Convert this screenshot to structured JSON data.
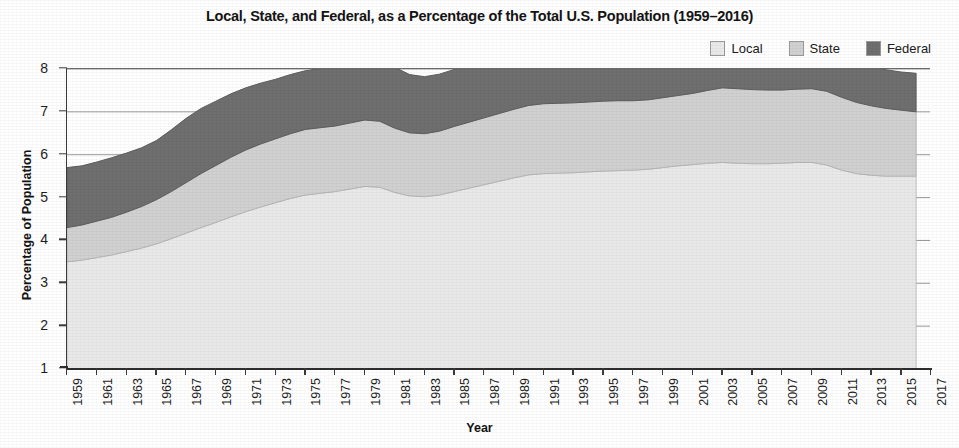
{
  "chart_data": {
    "type": "area",
    "stacked": true,
    "title": "Local, State, and Federal, as a Percentage of the Total U.S. Population (1959–2016)",
    "xlabel": "Year",
    "ylabel": "Percentage of Population",
    "xlim": [
      1959,
      2017
    ],
    "ylim": [
      1,
      8
    ],
    "ytick_step": 1,
    "xtick_step": 2,
    "grid": "horizontal",
    "legend_position": "top-right",
    "data_end_year": 2016,
    "ytick_labels": [
      "1",
      "2",
      "3",
      "4",
      "5",
      "6",
      "7",
      "8"
    ],
    "xtick_labels": [
      "1959",
      "1961",
      "1963",
      "1965",
      "1967",
      "1969",
      "1971",
      "1973",
      "1975",
      "1977",
      "1979",
      "1981",
      "1983",
      "1985",
      "1987",
      "1989",
      "1991",
      "1993",
      "1995",
      "1997",
      "1999",
      "2001",
      "2003",
      "2005",
      "2007",
      "2009",
      "2011",
      "2013",
      "2015",
      "2017"
    ],
    "x": [
      1959,
      1960,
      1961,
      1962,
      1963,
      1964,
      1965,
      1966,
      1967,
      1968,
      1969,
      1970,
      1971,
      1972,
      1973,
      1974,
      1975,
      1976,
      1977,
      1978,
      1979,
      1980,
      1981,
      1982,
      1983,
      1984,
      1985,
      1986,
      1987,
      1988,
      1989,
      1990,
      1991,
      1992,
      1993,
      1994,
      1995,
      1996,
      1997,
      1998,
      1999,
      2000,
      2001,
      2002,
      2003,
      2004,
      2005,
      2006,
      2007,
      2008,
      2009,
      2010,
      2011,
      2012,
      2013,
      2014,
      2015,
      2016
    ],
    "series": [
      {
        "name": "Local",
        "color": "#e9e9e9",
        "values": [
          2.5,
          2.54,
          2.6,
          2.66,
          2.74,
          2.82,
          2.92,
          3.04,
          3.17,
          3.3,
          3.42,
          3.55,
          3.67,
          3.78,
          3.88,
          3.98,
          4.06,
          4.1,
          4.14,
          4.2,
          4.26,
          4.24,
          4.12,
          4.04,
          4.02,
          4.06,
          4.14,
          4.22,
          4.3,
          4.38,
          4.46,
          4.53,
          4.56,
          4.57,
          4.58,
          4.6,
          4.62,
          4.63,
          4.64,
          4.66,
          4.7,
          4.74,
          4.77,
          4.8,
          4.82,
          4.8,
          4.79,
          4.79,
          4.8,
          4.82,
          4.82,
          4.76,
          4.64,
          4.56,
          4.52,
          4.5,
          4.5,
          4.5
        ]
      },
      {
        "name": "State",
        "color": "#d1d1d1",
        "values": [
          0.8,
          0.82,
          0.85,
          0.88,
          0.92,
          0.97,
          1.03,
          1.1,
          1.18,
          1.26,
          1.33,
          1.39,
          1.44,
          1.47,
          1.49,
          1.51,
          1.53,
          1.53,
          1.53,
          1.54,
          1.55,
          1.54,
          1.5,
          1.47,
          1.47,
          1.49,
          1.52,
          1.54,
          1.56,
          1.58,
          1.6,
          1.62,
          1.63,
          1.63,
          1.63,
          1.63,
          1.63,
          1.63,
          1.62,
          1.62,
          1.63,
          1.64,
          1.66,
          1.7,
          1.74,
          1.74,
          1.73,
          1.72,
          1.71,
          1.71,
          1.72,
          1.72,
          1.7,
          1.66,
          1.62,
          1.58,
          1.54,
          1.5
        ]
      },
      {
        "name": "Federal",
        "color": "#6f6f6f",
        "values": [
          1.4,
          1.38,
          1.38,
          1.39,
          1.38,
          1.37,
          1.38,
          1.44,
          1.5,
          1.52,
          1.5,
          1.48,
          1.45,
          1.42,
          1.39,
          1.38,
          1.37,
          1.38,
          1.4,
          1.44,
          1.46,
          1.52,
          1.42,
          1.36,
          1.33,
          1.33,
          1.33,
          1.33,
          1.32,
          1.32,
          1.32,
          1.34,
          1.4,
          1.36,
          1.33,
          1.3,
          1.26,
          1.22,
          1.18,
          1.16,
          1.15,
          1.2,
          1.12,
          1.08,
          1.06,
          1.04,
          1.02,
          1.01,
          1.0,
          1.0,
          1.02,
          1.06,
          1.0,
          0.96,
          0.92,
          0.9,
          0.89,
          0.9
        ]
      }
    ],
    "totals_note": "Values are percentages of total U.S. population; bands stack Local + State + Federal."
  },
  "legend": {
    "items": [
      {
        "label": "Local",
        "color": "#e9e9e9"
      },
      {
        "label": "State",
        "color": "#d1d1d1"
      },
      {
        "label": "Federal",
        "color": "#6f6f6f"
      }
    ]
  },
  "axes": {
    "y_title": "Percentage of Population",
    "x_title": "Year"
  }
}
